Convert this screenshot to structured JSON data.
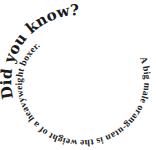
{
  "spiral": {
    "headline": "Did you know?",
    "fact": "A big male orang-utan is the weight of a heavyweight boxer."
  },
  "colors": {
    "text": "#1a1a1a",
    "background": "#ffffff"
  }
}
